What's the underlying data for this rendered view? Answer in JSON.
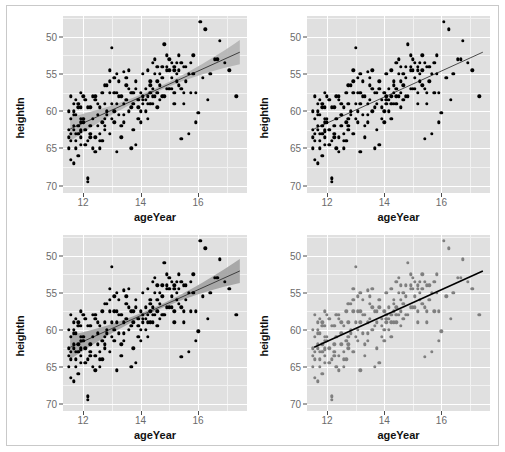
{
  "figure": {
    "layout": "2x2 grid of scatterplots",
    "border_color": "#c9c9c9",
    "panel_background": "#e0e0e0",
    "gridline_color": "#ffffff",
    "minor_gridline_color": "#f2f2f2"
  },
  "axis": {
    "xlabel": "ageYear",
    "ylabel": "heightIn",
    "xticks": [
      "12",
      "14",
      "16"
    ],
    "xtick_values": [
      12,
      14,
      16
    ],
    "yticks": [
      "70",
      "65",
      "60",
      "55",
      "50"
    ],
    "ytick_values": [
      70,
      65,
      60,
      55,
      50
    ],
    "tick_label_color": "#6b6b6b",
    "axis_title_color": "#111111"
  },
  "chart_data": {
    "type": "scatter",
    "title": "",
    "xlabel": "ageYear",
    "ylabel": "heightIn",
    "xlim": [
      11.3,
      17.7
    ],
    "ylim": [
      49.0,
      72.8
    ],
    "xticks": [
      12,
      14,
      16
    ],
    "yticks": [
      50,
      55,
      60,
      65,
      70
    ],
    "grid": true,
    "legend": "none",
    "panels": [
      {
        "id": "top-left",
        "position": "top-left",
        "point_color": "#000000",
        "fit": {
          "type": "linear",
          "line_color": "#3f3f3f",
          "line_width": 1,
          "confidence_band": true,
          "band_color": "#b0b0b0",
          "band_level": 0.95,
          "intercept": 37.4,
          "slope": 1.75
        }
      },
      {
        "id": "top-right",
        "position": "top-right",
        "point_color": "#000000",
        "fit": {
          "type": "linear",
          "line_color": "#4a4a4a",
          "line_width": 1,
          "confidence_band": false,
          "intercept": 37.4,
          "slope": 1.75
        }
      },
      {
        "id": "bottom-left",
        "position": "bottom-left",
        "point_color": "#000000",
        "fit": {
          "type": "linear",
          "line_color": "#3f3f3f",
          "line_width": 1,
          "confidence_band": true,
          "band_color": "#9e9e9e",
          "band_level": 0.95,
          "intercept": 37.4,
          "slope": 1.75
        }
      },
      {
        "id": "bottom-right",
        "position": "bottom-right",
        "point_color": "#7f7f7f",
        "fit": {
          "type": "linear",
          "line_color": "#000000",
          "line_width": 1.6,
          "confidence_band": false,
          "intercept": 37.4,
          "slope": 1.75
        }
      }
    ],
    "points": [
      [
        11.92,
        57.3
      ],
      [
        12.92,
        62.5
      ],
      [
        12.75,
        59.0
      ],
      [
        13.42,
        65.3
      ],
      [
        15.92,
        62.5
      ],
      [
        14.25,
        59.0
      ],
      [
        15.42,
        56.3
      ],
      [
        11.92,
        62.5
      ],
      [
        13.08,
        62.5
      ],
      [
        12.0,
        59.0
      ],
      [
        11.67,
        53.0
      ],
      [
        12.58,
        56.0
      ],
      [
        13.17,
        54.5
      ],
      [
        11.92,
        57.5
      ],
      [
        13.5,
        64.5
      ],
      [
        13.17,
        61.0
      ],
      [
        11.75,
        55.0
      ],
      [
        12.42,
        56.5
      ],
      [
        13.08,
        64.5
      ],
      [
        14.17,
        61.5
      ],
      [
        16.58,
        67.0
      ],
      [
        13.33,
        62.0
      ],
      [
        14.92,
        67.5
      ],
      [
        12.25,
        57.0
      ],
      [
        11.67,
        61.0
      ],
      [
        12.08,
        55.5
      ],
      [
        13.92,
        61.5
      ],
      [
        15.5,
        66.0
      ],
      [
        14.75,
        62.0
      ],
      [
        11.83,
        57.0
      ],
      [
        12.17,
        60.5
      ],
      [
        12.83,
        59.5
      ],
      [
        14.58,
        66.0
      ],
      [
        15.17,
        66.0
      ],
      [
        11.5,
        57.5
      ],
      [
        12.33,
        55.0
      ],
      [
        13.58,
        63.0
      ],
      [
        14.33,
        61.0
      ],
      [
        15.83,
        65.0
      ],
      [
        16.92,
        66.5
      ],
      [
        11.58,
        53.5
      ],
      [
        12.5,
        58.0
      ],
      [
        13.75,
        62.5
      ],
      [
        14.5,
        65.0
      ],
      [
        15.25,
        64.0
      ],
      [
        16.25,
        71.0
      ],
      [
        11.75,
        59.5
      ],
      [
        12.67,
        58.5
      ],
      [
        13.25,
        59.5
      ],
      [
        14.08,
        61.5
      ],
      [
        15.0,
        67.0
      ],
      [
        16.08,
        72.0
      ],
      [
        11.92,
        60.5
      ],
      [
        12.75,
        61.0
      ],
      [
        13.83,
        64.0
      ],
      [
        14.67,
        63.5
      ],
      [
        15.58,
        66.0
      ],
      [
        16.75,
        69.5
      ],
      [
        11.67,
        58.0
      ],
      [
        12.42,
        62.0
      ],
      [
        13.0,
        68.5
      ],
      [
        14.0,
        60.0
      ],
      [
        14.83,
        69.0
      ],
      [
        15.75,
        62.5
      ],
      [
        11.58,
        56.0
      ],
      [
        12.25,
        60.5
      ],
      [
        13.33,
        56.5
      ],
      [
        14.42,
        66.5
      ],
      [
        15.33,
        65.5
      ],
      [
        16.42,
        65.0
      ],
      [
        11.5,
        55.0
      ],
      [
        12.17,
        50.5
      ],
      [
        12.92,
        64.0
      ],
      [
        13.67,
        60.5
      ],
      [
        14.25,
        65.5
      ],
      [
        15.08,
        63.0
      ],
      [
        16.0,
        59.8
      ],
      [
        11.83,
        61.0
      ],
      [
        12.58,
        57.0
      ],
      [
        13.42,
        58.5
      ],
      [
        14.08,
        62.0
      ],
      [
        15.67,
        57.0
      ],
      [
        17.08,
        65.5
      ],
      [
        11.67,
        57.5
      ],
      [
        12.33,
        62.0
      ],
      [
        13.17,
        65.0
      ],
      [
        14.58,
        62.5
      ],
      [
        15.17,
        61.0
      ],
      [
        16.17,
        64.5
      ],
      [
        11.92,
        58.5
      ],
      [
        12.75,
        58.0
      ],
      [
        13.58,
        65.5
      ],
      [
        14.33,
        64.0
      ],
      [
        15.42,
        66.5
      ],
      [
        17.33,
        62.0
      ],
      [
        11.58,
        59.0
      ],
      [
        12.08,
        61.5
      ],
      [
        13.08,
        60.0
      ],
      [
        14.0,
        62.5
      ],
      [
        14.92,
        66.0
      ],
      [
        15.92,
        58.5
      ],
      [
        11.75,
        56.0
      ],
      [
        12.5,
        59.5
      ],
      [
        13.5,
        61.5
      ],
      [
        14.17,
        63.0
      ],
      [
        15.5,
        62.5
      ],
      [
        16.67,
        67.0
      ],
      [
        11.83,
        54.0
      ],
      [
        12.0,
        58.5
      ],
      [
        12.83,
        63.5
      ],
      [
        13.75,
        57.5
      ],
      [
        14.75,
        66.0
      ],
      [
        15.25,
        65.0
      ],
      [
        11.5,
        60.0
      ],
      [
        12.67,
        56.0
      ],
      [
        13.25,
        62.0
      ],
      [
        14.42,
        61.0
      ],
      [
        15.08,
        64.5
      ],
      [
        16.33,
        61.5
      ],
      [
        11.92,
        55.5
      ],
      [
        12.42,
        54.5
      ],
      [
        13.92,
        59.0
      ],
      [
        14.5,
        62.0
      ],
      [
        15.83,
        67.5
      ],
      [
        11.67,
        59.5
      ],
      [
        12.25,
        58.0
      ],
      [
        13.0,
        61.0
      ],
      [
        14.67,
        61.5
      ],
      [
        15.33,
        63.5
      ],
      [
        11.58,
        62.0
      ],
      [
        12.92,
        57.0
      ],
      [
        13.83,
        55.5
      ],
      [
        14.25,
        61.0
      ],
      [
        15.0,
        65.5
      ],
      [
        11.75,
        57.0
      ],
      [
        12.17,
        51.0
      ],
      [
        13.42,
        59.5
      ],
      [
        14.08,
        65.0
      ],
      [
        14.83,
        62.0
      ],
      [
        11.83,
        58.0
      ],
      [
        12.58,
        60.5
      ],
      [
        13.33,
        58.0
      ],
      [
        14.58,
        64.0
      ],
      [
        15.17,
        62.5
      ],
      [
        12.0,
        62.0
      ],
      [
        12.75,
        63.5
      ],
      [
        13.67,
        62.5
      ],
      [
        14.33,
        63.5
      ],
      [
        15.58,
        64.0
      ],
      [
        11.5,
        56.5
      ],
      [
        12.33,
        59.0
      ],
      [
        13.17,
        62.5
      ],
      [
        14.0,
        58.5
      ],
      [
        14.92,
        65.5
      ],
      [
        11.67,
        60.0
      ],
      [
        12.5,
        61.0
      ],
      [
        13.58,
        60.0
      ],
      [
        14.42,
        62.0
      ],
      [
        15.42,
        63.0
      ],
      [
        11.92,
        59.0
      ],
      [
        12.08,
        57.5
      ],
      [
        13.08,
        58.5
      ],
      [
        14.17,
        60.0
      ],
      [
        15.08,
        66.5
      ],
      [
        12.67,
        62.5
      ],
      [
        13.75,
        61.0
      ],
      [
        14.75,
        64.5
      ],
      [
        15.67,
        65.0
      ],
      [
        11.58,
        57.0
      ],
      [
        12.42,
        61.5
      ],
      [
        13.5,
        63.5
      ],
      [
        14.5,
        67.0
      ],
      [
        15.25,
        66.5
      ],
      [
        11.75,
        61.5
      ],
      [
        12.83,
        60.0
      ],
      [
        13.25,
        64.0
      ],
      [
        14.25,
        62.0
      ],
      [
        15.0,
        63.0
      ],
      [
        12.25,
        56.5
      ],
      [
        13.0,
        59.0
      ],
      [
        14.08,
        61.0
      ],
      [
        14.67,
        65.0
      ],
      [
        15.5,
        61.0
      ],
      [
        11.83,
        60.5
      ],
      [
        12.58,
        55.0
      ],
      [
        13.92,
        60.5
      ],
      [
        14.58,
        60.5
      ],
      [
        15.33,
        67.5
      ],
      [
        12.17,
        56.0
      ],
      [
        13.42,
        61.0
      ],
      [
        14.33,
        62.5
      ],
      [
        15.75,
        66.5
      ],
      [
        11.92,
        56.5
      ],
      [
        12.92,
        65.5
      ],
      [
        13.83,
        63.0
      ],
      [
        14.92,
        63.0
      ],
      [
        12.75,
        57.5
      ],
      [
        13.67,
        55.0
      ],
      [
        14.42,
        63.0
      ],
      [
        15.17,
        65.5
      ]
    ]
  }
}
